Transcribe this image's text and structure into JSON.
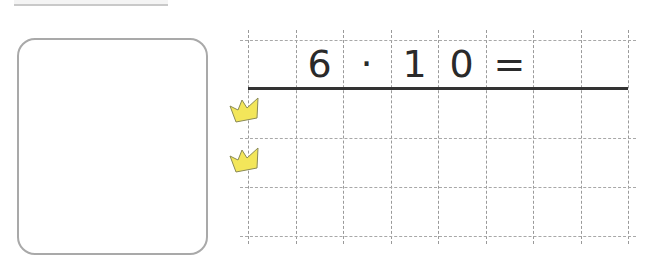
{
  "worksheet": {
    "equation": {
      "cells": [
        "",
        "6",
        "·",
        "1",
        "0",
        "=",
        "",
        ""
      ]
    },
    "grid": {
      "columns_x": [
        248,
        296,
        343,
        391,
        438,
        486,
        533,
        581,
        628
      ],
      "rows_y": [
        40,
        138,
        187,
        236
      ],
      "answer_line_y": 88
    },
    "markers": [
      {
        "type": "crown-icon",
        "color": "#f3e65a"
      },
      {
        "type": "crown-icon",
        "color": "#f3e65a"
      }
    ],
    "colors": {
      "grid_line": "#9a9a9a",
      "answer_line": "#333333",
      "box_border": "#a9a9a9",
      "crown_fill": "#f3e65a",
      "crown_stroke": "#8a8a55"
    }
  }
}
